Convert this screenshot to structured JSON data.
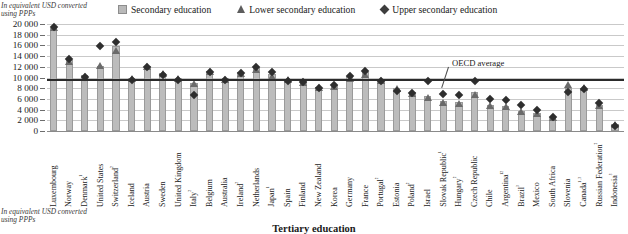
{
  "notes": {
    "top": "In equivalent USD converted using PPPs",
    "bottom": "In equivalent USD converted using PPPs"
  },
  "legend": [
    {
      "key": "secondary",
      "label": "Secondary education",
      "marker": "square",
      "color": "#b9b9b9"
    },
    {
      "key": "lower_secondary",
      "label": "Lower secondary education",
      "marker": "triangle",
      "color": "#5d5d5d"
    },
    {
      "key": "upper_secondary",
      "label": "Upper secondary education",
      "marker": "diamond",
      "color": "#3d3d3d"
    }
  ],
  "annotation": {
    "oecd_average_label": "OECD average"
  },
  "panel2": {
    "title": "Tertiary education"
  },
  "chart_data": {
    "type": "bar",
    "title": "",
    "xlabel": "",
    "ylabel": "In equivalent USD converted using PPPs",
    "ylim": [
      0,
      20000
    ],
    "yticks": [
      0,
      2000,
      4000,
      6000,
      8000,
      10000,
      12000,
      14000,
      16000,
      18000,
      20000
    ],
    "ytick_labels": [
      "0",
      "2 000",
      "4 000",
      "6 000",
      "8 000",
      "10 000",
      "12 000",
      "14 000",
      "16 000",
      "18 000",
      "20 000"
    ],
    "grid": true,
    "legend_position": "top",
    "oecd_average": 9500,
    "categories": [
      "Luxembourg",
      "Norway",
      "Denmark¹",
      "United States",
      "Switzerland²",
      "Iceland",
      "Austria",
      "Sweden",
      "United Kingdom",
      "Italy²",
      "Belgium",
      "Australia",
      "Ireland²",
      "Netherlands",
      "Japan¹",
      "Spain",
      "Finland",
      "New Zealand",
      "Korea",
      "Germany",
      "France",
      "Portugal²",
      "Estonia",
      "Poland²",
      "Israel",
      "Slovak Republic¹",
      "Hungary²",
      "Czech Republic",
      "Chile",
      "Argentina¹²",
      "Brazil³",
      "Mexico",
      "South Africa",
      "Slovenia",
      "Canada¹˒³",
      "Russian Federation²",
      "Indonesia³"
    ],
    "series": [
      {
        "name": "Secondary education",
        "marker": "square",
        "values": [
          19300,
          13300,
          10400,
          12200,
          15800,
          9900,
          12100,
          10900,
          9900,
          9000,
          11300,
          9900,
          11000,
          11900,
          10600,
          9800,
          9300,
          8300,
          8600,
          10300,
          11000,
          9600,
          8000,
          7300,
          6500,
          5600,
          5400,
          7300,
          4900,
          4700,
          3800,
          3300,
          2600,
          8000,
          8000,
          4900,
          1400
        ]
      },
      {
        "name": "Lower secondary education",
        "marker": "triangle",
        "values": [
          19400,
          13000,
          10100,
          12200,
          15000,
          9800,
          12000,
          10800,
          9800,
          8900,
          11200,
          9700,
          10700,
          11500,
          10200,
          9700,
          9000,
          8100,
          8300,
          9900,
          10500,
          9400,
          7900,
          7100,
          6300,
          5300,
          5200,
          6900,
          4700,
          4600,
          3700,
          3200,
          2500,
          8600,
          8100,
          4800,
          1300
        ]
      },
      {
        "name": "Upper secondary education",
        "marker": "diamond",
        "values": [
          19900,
          14000,
          10700,
          16500,
          17100,
          10100,
          12400,
          11000,
          10100,
          7300,
          11500,
          10100,
          11400,
          12400,
          11600,
          9900,
          9700,
          8600,
          9100,
          10900,
          11700,
          9900,
          8000,
          7600,
          9800,
          7400,
          7300,
          9800,
          6500,
          6400,
          5300,
          4400,
          3100,
          7900,
          8400,
          5800,
          1500
        ]
      }
    ]
  }
}
